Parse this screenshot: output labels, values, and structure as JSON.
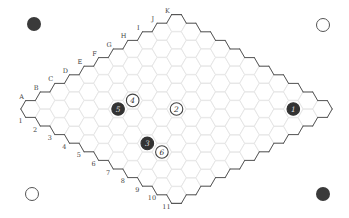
{
  "game": "Hex",
  "board": {
    "size": 11,
    "columns": [
      "A",
      "B",
      "C",
      "D",
      "E",
      "F",
      "G",
      "H",
      "I",
      "J",
      "K"
    ],
    "rows": [
      "1",
      "2",
      "3",
      "4",
      "5",
      "6",
      "7",
      "8",
      "9",
      "10",
      "11"
    ],
    "colors": {
      "cell_line": "#e2e2e2",
      "border": "#555555",
      "black_stone": "#333333",
      "white_stone": "#ffffff",
      "label": "#444444"
    }
  },
  "stones": [
    {
      "number": "1",
      "color": "black",
      "cell": "J10",
      "col": 9,
      "row": 9
    },
    {
      "number": "2",
      "color": "white",
      "cell": "F6",
      "col": 5,
      "row": 5
    },
    {
      "number": "3",
      "color": "black",
      "cell": "C7",
      "col": 2,
      "row": 6
    },
    {
      "number": "4",
      "color": "white",
      "cell": "E4",
      "col": 4,
      "row": 3
    },
    {
      "number": "5",
      "color": "black",
      "cell": "D4",
      "col": 3,
      "row": 3
    },
    {
      "number": "6",
      "color": "white",
      "cell": "C8",
      "col": 2,
      "row": 7
    }
  ],
  "corner_markers": [
    {
      "position": "top-left",
      "color": "black"
    },
    {
      "position": "top-right",
      "color": "white"
    },
    {
      "position": "bottom-left",
      "color": "white"
    },
    {
      "position": "bottom-right",
      "color": "black"
    }
  ]
}
